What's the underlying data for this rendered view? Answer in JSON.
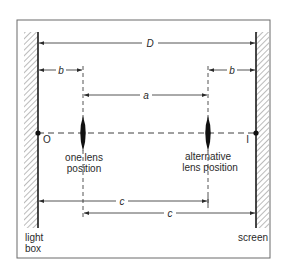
{
  "diagram": {
    "colors": {
      "ink": "#2a2a2a",
      "frame": "#6a6a6a",
      "background": "#ffffff"
    },
    "dimensions": {
      "D": "D",
      "b_left": "b",
      "b_right": "b",
      "a": "a",
      "c_upper": "c",
      "c_lower": "c"
    },
    "points": {
      "object": "O",
      "image": "I"
    },
    "labels": {
      "lens1_line1": "one lens",
      "lens1_line2": "position",
      "lens2_line1": "alternative",
      "lens2_line2": "lens position",
      "lightbox_line1": "light",
      "lightbox_line2": "box",
      "screen": "screen"
    }
  }
}
